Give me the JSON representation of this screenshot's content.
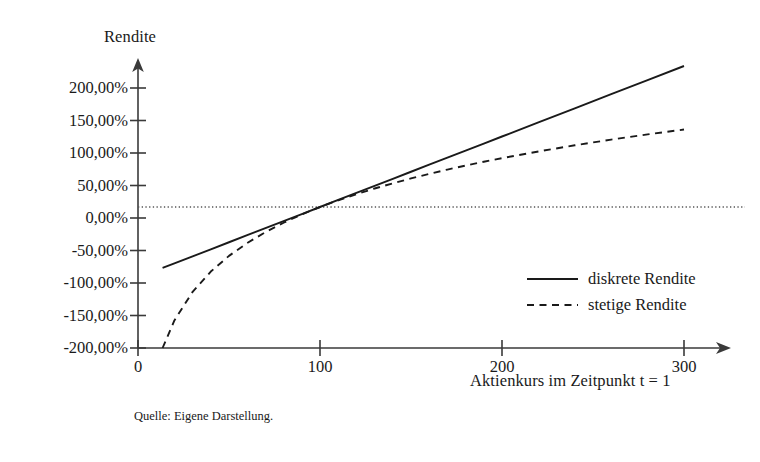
{
  "caption": "Quelle: Eigene Darstellung.",
  "axes": {
    "y_title": "Rendite",
    "x_title": "Aktienkurs im Zeitpunkt t = 1",
    "y_tick_labels": [
      "200,00%",
      "150,00%",
      "100,00%",
      "50,00%",
      "0,00%",
      "-50,00%",
      "-100,00%",
      "-150,00%",
      "-200,00%"
    ],
    "x_tick_labels": [
      "0",
      "100",
      "200",
      "300"
    ]
  },
  "legend": {
    "items": [
      {
        "label": "diskrete Rendite",
        "style": "solid"
      },
      {
        "label": "stetige Rendite",
        "style": "dashed"
      }
    ]
  },
  "colors": {
    "line": "#1a1a1a",
    "axis": "#3a3a3a",
    "zero_line": "#555555",
    "background": "#ffffff"
  },
  "chart_data": {
    "type": "line",
    "title": "",
    "xlabel": "Aktienkurs im Zeitpunkt t = 1",
    "ylabel": "Rendite",
    "xlim": [
      0,
      310
    ],
    "ylim": [
      -200,
      200
    ],
    "xticks": [
      0,
      100,
      200,
      300
    ],
    "yticks": [
      -200,
      -150,
      -100,
      -50,
      0,
      50,
      100,
      150,
      200
    ],
    "ytick_format": "percent_de",
    "grid": false,
    "zero_reference_line": {
      "y": 0,
      "style": "dotted"
    },
    "legend_position": "center-right",
    "reference_price": 100,
    "x": [
      13.5,
      20,
      30,
      40,
      50,
      60,
      70,
      80,
      90,
      100,
      110,
      120,
      130,
      140,
      150,
      160,
      170,
      180,
      190,
      200,
      220,
      240,
      260,
      280,
      300
    ],
    "series": [
      {
        "name": "diskrete Rendite",
        "style": "solid",
        "formula": "S/S0 - 1",
        "values": [
          -86.5,
          -80,
          -70,
          -60,
          -50,
          -40,
          -30,
          -20,
          -10,
          0,
          10,
          20,
          30,
          40,
          50,
          60,
          70,
          80,
          90,
          100,
          120,
          140,
          160,
          180,
          200
        ]
      },
      {
        "name": "stetige Rendite",
        "style": "dashed",
        "formula": "ln(S/S0)",
        "values": [
          -200.2,
          -160.9,
          -120.4,
          -91.6,
          -69.3,
          -51.1,
          -35.7,
          -22.3,
          -10.5,
          0,
          9.5,
          18.2,
          26.2,
          33.6,
          40.5,
          47.0,
          53.1,
          58.8,
          64.2,
          69.3,
          78.8,
          87.5,
          95.6,
          103.0,
          109.9
        ]
      }
    ]
  }
}
